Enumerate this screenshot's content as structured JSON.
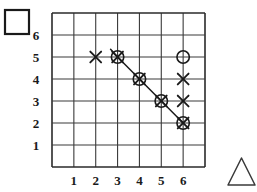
{
  "figure": {
    "shape_icons": [
      {
        "name": "square-icon",
        "shape": "square",
        "fill": "none",
        "stroke": "#1a1a1a",
        "x": 5,
        "y": 10,
        "size": 24
      },
      {
        "name": "triangle-icon",
        "shape": "triangle",
        "fill": "none",
        "stroke": "#3a3a3a",
        "x": 228,
        "y": 158,
        "width": 27,
        "height": 27
      }
    ],
    "grid": {
      "x_left": 52,
      "x_right": 205,
      "y_top": 13,
      "y_bottom": 167,
      "columns": 7,
      "rows": 7,
      "line_color": "#3a3a3a",
      "border_color": "#2a2a2a"
    }
  },
  "chart_data": {
    "type": "scatter",
    "title": "",
    "xlabel": "",
    "ylabel": "",
    "xlim": [
      0,
      7
    ],
    "ylim": [
      0,
      7
    ],
    "grid": true,
    "legend": null,
    "xticks": [
      1,
      2,
      3,
      4,
      5,
      6
    ],
    "yticks": [
      1,
      2,
      3,
      4,
      5,
      6
    ],
    "xticklabels": [
      "1",
      "2",
      "3",
      "4",
      "5",
      "6"
    ],
    "yticklabels": [
      "1",
      "2",
      "3",
      "4",
      "5",
      "6"
    ],
    "series": [
      {
        "name": "cross-markers",
        "marker": "x",
        "color": "#1a1a1a",
        "points": [
          {
            "x": 2,
            "y": 5
          },
          {
            "x": 6,
            "y": 4
          },
          {
            "x": 6,
            "y": 3
          }
        ]
      },
      {
        "name": "circle-markers",
        "marker": "o",
        "color": "#1a1a1a",
        "points": [
          {
            "x": 6,
            "y": 5
          }
        ]
      },
      {
        "name": "circled-cross-markers",
        "marker": "circled-x",
        "color": "#1a1a1a",
        "points": [
          {
            "x": 3,
            "y": 5
          },
          {
            "x": 4,
            "y": 4
          },
          {
            "x": 5,
            "y": 3
          },
          {
            "x": 6,
            "y": 2
          }
        ]
      }
    ],
    "lines": [
      {
        "name": "diagonal-trend-line",
        "color": "#1a1a1a",
        "points": [
          {
            "x": 2.68,
            "y": 5.35
          },
          {
            "x": 3,
            "y": 5
          },
          {
            "x": 4,
            "y": 4
          },
          {
            "x": 5,
            "y": 3
          },
          {
            "x": 6,
            "y": 2
          }
        ]
      }
    ]
  }
}
